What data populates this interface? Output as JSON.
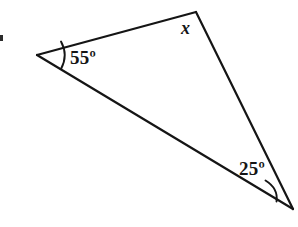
{
  "figure": {
    "kind": "geometry-diagram",
    "shape": "triangle",
    "background_color": "#ffffff",
    "stroke_color": "#151515",
    "stroke_width": 2.2,
    "width": 298,
    "height": 227,
    "vertices": [
      {
        "name": "left-vertex",
        "x": 37,
        "y": 55
      },
      {
        "name": "top-right-vertex",
        "x": 196,
        "y": 12
      },
      {
        "name": "bottom-right-vertex",
        "x": 293,
        "y": 209
      }
    ],
    "edges": [
      {
        "name": "top-edge",
        "from": "left-vertex",
        "to": "top-right-vertex"
      },
      {
        "name": "right-edge",
        "from": "top-right-vertex",
        "to": "bottom-right-vertex"
      },
      {
        "name": "bottom-edge",
        "from": "bottom-right-vertex",
        "to": "left-vertex"
      }
    ],
    "angle_arcs": [
      {
        "name": "arc-left-vertex",
        "at": "left-vertex",
        "path": "M 61 42 Q 68 55 61 69"
      },
      {
        "name": "arc-bottom-right-vertex",
        "at": "bottom-right-vertex",
        "path": "M 266 181 Q 278 189 276 201"
      }
    ],
    "labels": {
      "angle_left": "55º",
      "angle_bottom_right": "25º",
      "angle_top_unknown": "x"
    },
    "artifact": {
      "name": "left-edge-speck",
      "color": "#2b2b2b"
    }
  }
}
